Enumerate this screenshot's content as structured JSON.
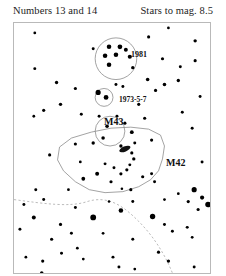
{
  "header": {
    "left_text": "Numbers 13 and 14",
    "right_text": "Stars to mag. 8.5"
  },
  "chart": {
    "title_objects": [
      "NGC 1981",
      "NGC 1973-5-7",
      "M43",
      "M42"
    ],
    "frame": {
      "x": 13,
      "y": 22,
      "width": 198,
      "height": 252
    },
    "border_color": "#b9b9b9",
    "star_color": "#000000",
    "outline_color": "#8a8a8a",
    "dashed_color": "#a9a9a9",
    "labels": [
      {
        "name": "label-1981",
        "text": "1981",
        "x": 117,
        "y": 28
      },
      {
        "name": "label-1973",
        "text": "1973-5-7",
        "x": 105,
        "y": 73
      },
      {
        "name": "label-m43",
        "text": "M43",
        "x": 90,
        "y": 94
      },
      {
        "name": "label-m42",
        "text": "M42",
        "x": 152,
        "y": 135
      }
    ],
    "clusters": [
      {
        "name": "ngc-1981-circle",
        "cx": 103,
        "cy": 36,
        "r": 21
      },
      {
        "name": "ngc-1973-circle",
        "cx": 91,
        "cy": 75,
        "r": 9
      },
      {
        "name": "m43-circle",
        "cx": 97,
        "cy": 109,
        "r": 15
      }
    ],
    "nebula_outline": {
      "name": "m42-nebula-outline",
      "points": "46,125 58,116 78,110 98,106 118,105 136,107 148,113 152,124 150,137 146,149 138,158 126,165 110,170 92,171 76,168 62,160 50,149 44,138"
    },
    "dashed_curve": {
      "name": "ecliptic-dashed-curve",
      "path": "M 0,178 C 30,182 56,186 74,180 C 96,173 112,186 126,200 C 140,214 152,232 160,252"
    },
    "stars": [
      {
        "x": 21,
        "y": 10,
        "r": 1.4
      },
      {
        "x": 156,
        "y": 5,
        "r": 1.4
      },
      {
        "x": 183,
        "y": 18,
        "r": 1.7
      },
      {
        "x": 136,
        "y": 14,
        "r": 1.6
      },
      {
        "x": 80,
        "y": 26,
        "r": 1.5
      },
      {
        "x": 96,
        "y": 24,
        "r": 2.3
      },
      {
        "x": 107,
        "y": 24,
        "r": 2.4
      },
      {
        "x": 113,
        "y": 27,
        "r": 2.0
      },
      {
        "x": 92,
        "y": 33,
        "r": 2.3
      },
      {
        "x": 103,
        "y": 32,
        "r": 2.3
      },
      {
        "x": 117,
        "y": 34,
        "r": 2.1
      },
      {
        "x": 96,
        "y": 42,
        "r": 2.3
      },
      {
        "x": 120,
        "y": 45,
        "r": 1.7
      },
      {
        "x": 150,
        "y": 36,
        "r": 1.6
      },
      {
        "x": 168,
        "y": 44,
        "r": 1.5
      },
      {
        "x": 183,
        "y": 38,
        "r": 1.6
      },
      {
        "x": 21,
        "y": 46,
        "r": 1.5
      },
      {
        "x": 43,
        "y": 60,
        "r": 1.7
      },
      {
        "x": 62,
        "y": 66,
        "r": 1.6
      },
      {
        "x": 135,
        "y": 57,
        "r": 1.8
      },
      {
        "x": 152,
        "y": 62,
        "r": 1.8
      },
      {
        "x": 166,
        "y": 58,
        "r": 1.7
      },
      {
        "x": 143,
        "y": 68,
        "r": 1.6
      },
      {
        "x": 103,
        "y": 62,
        "r": 1.5
      },
      {
        "x": 85,
        "y": 70,
        "r": 2.6
      },
      {
        "x": 93,
        "y": 75,
        "r": 2.4
      },
      {
        "x": 110,
        "y": 64,
        "r": 1.5
      },
      {
        "x": 126,
        "y": 82,
        "r": 1.6
      },
      {
        "x": 188,
        "y": 74,
        "r": 1.5
      },
      {
        "x": 30,
        "y": 88,
        "r": 1.6
      },
      {
        "x": 47,
        "y": 82,
        "r": 1.7
      },
      {
        "x": 20,
        "y": 94,
        "r": 1.4
      },
      {
        "x": 68,
        "y": 92,
        "r": 1.5
      },
      {
        "x": 86,
        "y": 94,
        "r": 1.5
      },
      {
        "x": 104,
        "y": 94,
        "r": 1.5
      },
      {
        "x": 94,
        "y": 104,
        "r": 1.8
      },
      {
        "x": 112,
        "y": 101,
        "r": 1.6
      },
      {
        "x": 119,
        "y": 110,
        "r": 1.9
      },
      {
        "x": 90,
        "y": 116,
        "r": 1.8
      },
      {
        "x": 132,
        "y": 96,
        "r": 1.6
      },
      {
        "x": 170,
        "y": 90,
        "r": 1.5
      },
      {
        "x": 180,
        "y": 106,
        "r": 1.5
      },
      {
        "x": 62,
        "y": 122,
        "r": 1.6
      },
      {
        "x": 80,
        "y": 121,
        "r": 1.7
      },
      {
        "x": 108,
        "y": 124,
        "r": 1.7
      },
      {
        "x": 122,
        "y": 121,
        "r": 1.5
      },
      {
        "x": 139,
        "y": 118,
        "r": 1.6
      },
      {
        "x": 36,
        "y": 133,
        "r": 1.6
      },
      {
        "x": 67,
        "y": 140,
        "r": 1.4
      },
      {
        "x": 119,
        "y": 131,
        "r": 1.6
      },
      {
        "x": 121,
        "y": 137,
        "r": 1.7
      },
      {
        "x": 117,
        "y": 143,
        "r": 1.5
      },
      {
        "x": 114,
        "y": 148,
        "r": 1.6
      },
      {
        "x": 108,
        "y": 152,
        "r": 1.6
      },
      {
        "x": 101,
        "y": 146,
        "r": 1.5
      },
      {
        "x": 92,
        "y": 142,
        "r": 1.5
      },
      {
        "x": 84,
        "y": 152,
        "r": 2.0
      },
      {
        "x": 70,
        "y": 157,
        "r": 1.9
      },
      {
        "x": 98,
        "y": 160,
        "r": 1.6
      },
      {
        "x": 130,
        "y": 155,
        "r": 1.6
      },
      {
        "x": 139,
        "y": 152,
        "r": 1.5
      },
      {
        "x": 142,
        "y": 160,
        "r": 1.5
      },
      {
        "x": 109,
        "y": 167,
        "r": 1.3
      },
      {
        "x": 55,
        "y": 168,
        "r": 1.4
      },
      {
        "x": 120,
        "y": 180,
        "r": 1.5
      },
      {
        "x": 166,
        "y": 172,
        "r": 1.4
      },
      {
        "x": 22,
        "y": 168,
        "r": 1.5
      },
      {
        "x": 10,
        "y": 183,
        "r": 1.5
      },
      {
        "x": 118,
        "y": 168,
        "r": 1.6
      },
      {
        "x": 182,
        "y": 168,
        "r": 2.6
      },
      {
        "x": 190,
        "y": 176,
        "r": 2.1
      },
      {
        "x": 196,
        "y": 183,
        "r": 2.8
      },
      {
        "x": 186,
        "y": 188,
        "r": 1.6
      },
      {
        "x": 176,
        "y": 180,
        "r": 1.6
      },
      {
        "x": 20,
        "y": 196,
        "r": 2.0
      },
      {
        "x": 47,
        "y": 203,
        "r": 1.6
      },
      {
        "x": 108,
        "y": 189,
        "r": 2.3
      },
      {
        "x": 80,
        "y": 196,
        "r": 2.9
      },
      {
        "x": 140,
        "y": 195,
        "r": 2.7
      },
      {
        "x": 58,
        "y": 212,
        "r": 1.5
      },
      {
        "x": 38,
        "y": 218,
        "r": 1.6
      },
      {
        "x": 90,
        "y": 212,
        "r": 1.4
      },
      {
        "x": 152,
        "y": 203,
        "r": 1.5
      },
      {
        "x": 160,
        "y": 210,
        "r": 1.5
      },
      {
        "x": 175,
        "y": 206,
        "r": 1.5
      },
      {
        "x": 180,
        "y": 216,
        "r": 1.4
      },
      {
        "x": 120,
        "y": 218,
        "r": 1.5
      },
      {
        "x": 64,
        "y": 227,
        "r": 1.4
      },
      {
        "x": 48,
        "y": 232,
        "r": 1.5
      },
      {
        "x": 70,
        "y": 238,
        "r": 1.4
      },
      {
        "x": 29,
        "y": 240,
        "r": 1.6
      },
      {
        "x": 100,
        "y": 236,
        "r": 1.5
      },
      {
        "x": 146,
        "y": 231,
        "r": 1.6
      },
      {
        "x": 156,
        "y": 240,
        "r": 1.7
      },
      {
        "x": 190,
        "y": 140,
        "r": 1.5
      },
      {
        "x": 6,
        "y": 208,
        "r": 1.5
      },
      {
        "x": 12,
        "y": 236,
        "r": 1.4
      },
      {
        "x": 28,
        "y": 252,
        "r": 1.8
      },
      {
        "x": 106,
        "y": 246,
        "r": 1.5
      },
      {
        "x": 122,
        "y": 248,
        "r": 1.4
      },
      {
        "x": 182,
        "y": 246,
        "r": 1.5
      },
      {
        "x": 62,
        "y": 186,
        "r": 1.5
      },
      {
        "x": 30,
        "y": 178,
        "r": 1.5
      },
      {
        "x": 152,
        "y": 178,
        "r": 1.4
      },
      {
        "x": 96,
        "y": 180,
        "r": 1.3
      }
    ],
    "trapezium_blob": {
      "name": "trapezium-blob",
      "cx": 112,
      "cy": 127,
      "rx": 6,
      "ry": 2.6,
      "rotation": -22
    }
  }
}
